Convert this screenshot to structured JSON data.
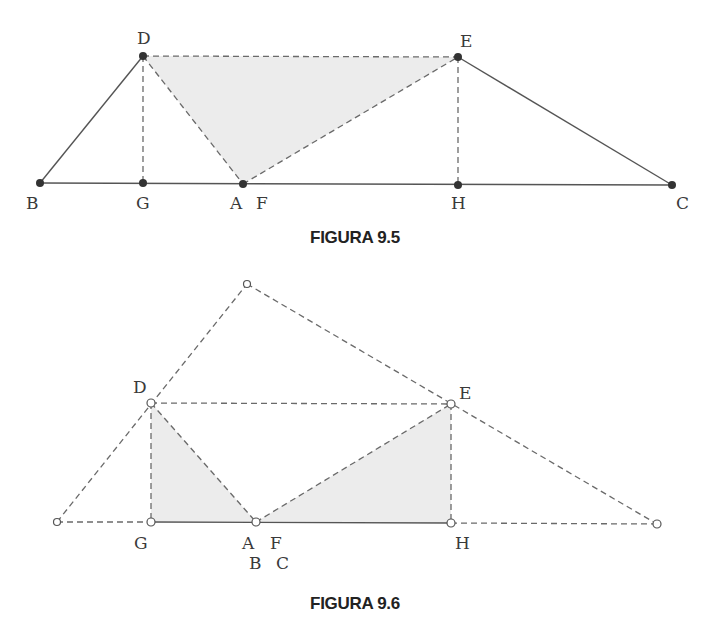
{
  "figure_9_5": {
    "caption": "FIGURA 9.5",
    "labels": {
      "D": "D",
      "E": "E",
      "B": "B",
      "G": "G",
      "A": "A",
      "F": "F",
      "H": "H",
      "C": "C"
    },
    "points": {
      "D": [
        143,
        56
      ],
      "E": [
        458,
        57
      ],
      "B": [
        40,
        183
      ],
      "G": [
        143,
        183
      ],
      "A": [
        243,
        184
      ],
      "H": [
        458,
        185
      ],
      "C": [
        672,
        185
      ]
    },
    "solid_segments": [
      [
        "B",
        "D"
      ],
      [
        "B",
        "C"
      ],
      [
        "E",
        "C"
      ]
    ],
    "dashed_segments": [
      [
        "D",
        "E"
      ],
      [
        "D",
        "G"
      ],
      [
        "D",
        "A"
      ],
      [
        "A",
        "E"
      ],
      [
        "E",
        "H"
      ]
    ],
    "shaded_region": [
      "D",
      "E",
      "A"
    ],
    "point_style": "filled-dot"
  },
  "figure_9_6": {
    "caption": "FIGURA 9.6",
    "labels": {
      "D": "D",
      "E": "E",
      "G": "G",
      "A": "A",
      "F": "F",
      "B": "B",
      "C": "C",
      "H": "H"
    },
    "points": {
      "apex": [
        247,
        284
      ],
      "D": [
        151,
        403
      ],
      "E": [
        451,
        404
      ],
      "left": [
        57,
        522
      ],
      "G": [
        151,
        522
      ],
      "A": [
        256,
        522
      ],
      "H": [
        451,
        523
      ],
      "right": [
        657,
        524
      ]
    },
    "solid_segments": [
      [
        "G",
        "H"
      ]
    ],
    "dashed_segments": [
      [
        "left",
        "apex"
      ],
      [
        "apex",
        "right"
      ],
      [
        "D",
        "E"
      ],
      [
        "D",
        "G"
      ],
      [
        "D",
        "A"
      ],
      [
        "A",
        "E"
      ],
      [
        "E",
        "H"
      ],
      [
        "left",
        "G"
      ],
      [
        "H",
        "right"
      ]
    ],
    "shaded_regions": [
      [
        "D",
        "G",
        "A"
      ],
      [
        "A",
        "E",
        "H"
      ]
    ],
    "point_style": "open-circle"
  }
}
